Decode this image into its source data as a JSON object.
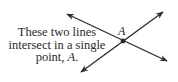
{
  "caption": {
    "line1": "These two lines",
    "line2": "intersect in a single",
    "line3_prefix": "point, ",
    "line3_point": "A",
    "line3_suffix": "."
  },
  "point_label": "A",
  "figure": {
    "line1": {
      "from": [
        67,
        14
      ],
      "to": [
        167,
        61
      ]
    },
    "line2": {
      "from": [
        81,
        72
      ],
      "to": [
        163,
        12
      ]
    },
    "intersection": [
      123,
      41
    ],
    "stroke_color": "#2a2a2a"
  }
}
